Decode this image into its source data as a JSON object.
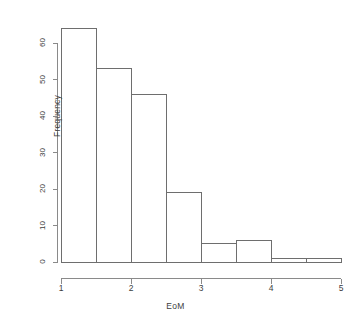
{
  "chart_data": {
    "type": "bar",
    "chart_kind": "histogram",
    "title": "",
    "subtitle": "",
    "xlabel": "EoM",
    "ylabel": "Frequency",
    "bin_width": 0.5,
    "bin_edges": [
      1,
      1.5,
      2,
      2.5,
      3,
      3.5,
      4,
      4.5,
      5
    ],
    "categories": [
      "1-1.5",
      "1.5-2",
      "2-2.5",
      "2.5-3",
      "3-3.5",
      "3.5-4",
      "4-4.5",
      "4.5-5"
    ],
    "values": [
      64,
      53,
      46,
      19,
      5,
      6,
      1,
      1
    ],
    "bin_centers": [
      1.25,
      1.75,
      2.25,
      2.75,
      3.25,
      3.75,
      4.25,
      4.75
    ],
    "xlim": [
      1,
      5
    ],
    "ylim": [
      0,
      64
    ],
    "x_ticks": [
      1,
      2,
      3,
      4,
      5
    ],
    "x_tick_labels": [
      "1",
      "2",
      "3",
      "4",
      "5"
    ],
    "y_ticks": [
      0,
      10,
      20,
      30,
      40,
      50,
      60
    ],
    "y_tick_labels": [
      "0",
      "10",
      "20",
      "30",
      "40",
      "50",
      "60"
    ],
    "grid": false,
    "legend": null,
    "legend_position": "none",
    "bar_fill_color": "#ffffff",
    "bar_border_color": "#6e6e6e",
    "axis_color": "#8a8a8a",
    "text_color": "#3d3d3d",
    "background_color": "#ffffff",
    "annotations": []
  }
}
